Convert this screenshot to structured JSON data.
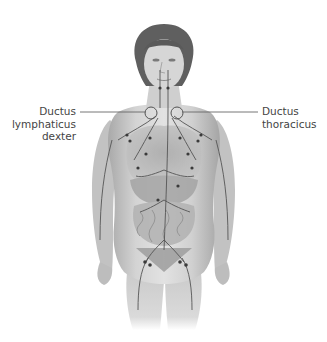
{
  "figure": {
    "labels": [
      {
        "id": "left",
        "text": "Ductus\nlymphaticus\ndexter"
      },
      {
        "id": "right",
        "text": "Ductus\nthoracicus"
      }
    ],
    "colors": {
      "skin_light": "#dcdcdc",
      "skin_mid": "#bdbdbd",
      "skin_dark": "#8a8a8a",
      "hair": "#5a5a5a",
      "vessel": "#555555",
      "node": "#3a3a3a",
      "leader_line": "#666666",
      "label_text": "#444444"
    }
  }
}
